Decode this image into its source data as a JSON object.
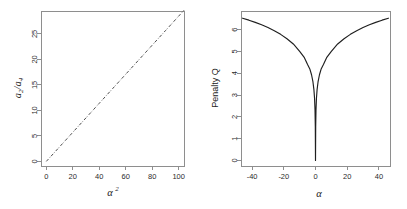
{
  "figure": {
    "background_color": "#ffffff",
    "axis_color": "#8e8e8e",
    "line_color": "#3a3a3a",
    "curve_color": "#1f1f1f",
    "panel_count": 2
  },
  "chart_data": [
    {
      "type": "line",
      "panel": "left",
      "title": "",
      "xlabel": "α²",
      "xlabel_base": "α",
      "xlabel_exponent": "2",
      "ylabel": "a₂/a₄",
      "ylabel_base_1": "a",
      "ylabel_sub_1": "2",
      "ylabel_separator": "/",
      "ylabel_base_2": "a",
      "ylabel_sub_2": "4",
      "xlim": [
        -4,
        104
      ],
      "ylim": [
        -0.9,
        29.5
      ],
      "xticks": [
        0,
        20,
        40,
        60,
        80,
        100
      ],
      "xticklabels": [
        "0",
        "20",
        "40",
        "60",
        "80",
        "100"
      ],
      "yticks": [
        0,
        5,
        10,
        15,
        20,
        25
      ],
      "yticklabels": [
        "0",
        "5",
        "10",
        "15",
        "20",
        "25"
      ],
      "grid": false,
      "legend": "none",
      "linestyle": "dashdot",
      "x": [
        0,
        10,
        20,
        30,
        40,
        50,
        60,
        70,
        80,
        90,
        100,
        104
      ],
      "y": [
        0,
        2.85,
        5.7,
        8.55,
        11.4,
        14.25,
        17.1,
        19.95,
        22.8,
        25.65,
        28.5,
        29.64
      ]
    },
    {
      "type": "line",
      "panel": "right",
      "title": "",
      "xlabel": "α",
      "ylabel": "Penalty Q",
      "xlim": [
        -47,
        47
      ],
      "ylim": [
        -0.25,
        6.85
      ],
      "xticks": [
        -40,
        -20,
        0,
        20,
        40
      ],
      "xticklabels": [
        "-40",
        "-20",
        "0",
        "20",
        "40"
      ],
      "yticks": [
        0,
        1,
        2,
        3,
        4,
        5,
        6
      ],
      "yticklabels": [
        "0",
        "1",
        "2",
        "3",
        "4",
        "5",
        "6"
      ],
      "grid": false,
      "legend": "none",
      "linestyle": "solid",
      "x": [
        -46,
        -42,
        -38,
        -34,
        -30,
        -26,
        -22,
        -18,
        -14,
        -10,
        -7,
        -5,
        -3.5,
        -2.5,
        -1.6,
        -1.0,
        -0.6,
        -0.3,
        -0.12,
        0,
        0.12,
        0.3,
        0.6,
        1.0,
        1.6,
        2.5,
        3.5,
        5,
        7,
        10,
        14,
        18,
        22,
        26,
        30,
        34,
        38,
        42,
        46
      ],
      "y": [
        6.52,
        6.43,
        6.33,
        6.22,
        6.09,
        5.95,
        5.78,
        5.58,
        5.34,
        5.0,
        4.71,
        4.4,
        4.18,
        3.93,
        3.6,
        3.25,
        2.85,
        2.3,
        1.55,
        0,
        1.55,
        2.3,
        2.85,
        3.25,
        3.6,
        3.93,
        4.18,
        4.4,
        4.71,
        5.0,
        5.34,
        5.58,
        5.78,
        5.95,
        6.09,
        6.22,
        6.33,
        6.43,
        6.52
      ]
    }
  ]
}
